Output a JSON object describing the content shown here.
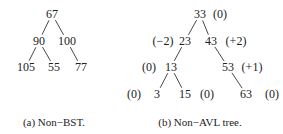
{
  "figure_a": {
    "caption": "(a)  Non−BST.",
    "nodes": [
      {
        "id": "a67",
        "label": "67",
        "x": 52,
        "y": 14
      },
      {
        "id": "a90",
        "label": "90",
        "x": 39,
        "y": 41
      },
      {
        "id": "a100",
        "label": "100",
        "x": 67,
        "y": 41
      },
      {
        "id": "a105",
        "label": "105",
        "x": 26,
        "y": 67
      },
      {
        "id": "a55",
        "label": "55",
        "x": 54,
        "y": 67
      },
      {
        "id": "a77",
        "label": "77",
        "x": 81,
        "y": 67
      }
    ],
    "edges": [
      [
        "a67",
        "a90"
      ],
      [
        "a67",
        "a100"
      ],
      [
        "a90",
        "a105"
      ],
      [
        "a90",
        "a55"
      ],
      [
        "a100",
        "a77"
      ]
    ]
  },
  "figure_b": {
    "caption": "(b)  Non−AVL tree.",
    "nodes": [
      {
        "id": "b33",
        "label": "33",
        "x": 200,
        "y": 14,
        "balance": "(0)",
        "bx": 220
      },
      {
        "id": "b23",
        "label": "23",
        "x": 185,
        "y": 41,
        "balance": "(−2)",
        "bx": 163
      },
      {
        "id": "b43",
        "label": "43",
        "x": 211,
        "y": 41,
        "balance": "(+2)",
        "bx": 236
      },
      {
        "id": "b13",
        "label": "13",
        "x": 171,
        "y": 67,
        "balance": "(0)",
        "bx": 149
      },
      {
        "id": "b53",
        "label": "53",
        "x": 228,
        "y": 67,
        "balance": "(+1)",
        "bx": 252
      },
      {
        "id": "b3",
        "label": "3",
        "x": 157,
        "y": 94,
        "balance": "(0)",
        "bx": 134
      },
      {
        "id": "b15",
        "label": "15",
        "x": 185,
        "y": 94,
        "balance": "(0)",
        "bx": 207
      },
      {
        "id": "b63",
        "label": "63",
        "x": 246,
        "y": 94,
        "balance": "(0)",
        "bx": 272
      }
    ],
    "edges": [
      [
        "b33",
        "b23"
      ],
      [
        "b33",
        "b43"
      ],
      [
        "b23",
        "b13"
      ],
      [
        "b43",
        "b53"
      ],
      [
        "b13",
        "b3"
      ],
      [
        "b13",
        "b15"
      ],
      [
        "b53",
        "b63"
      ]
    ]
  }
}
